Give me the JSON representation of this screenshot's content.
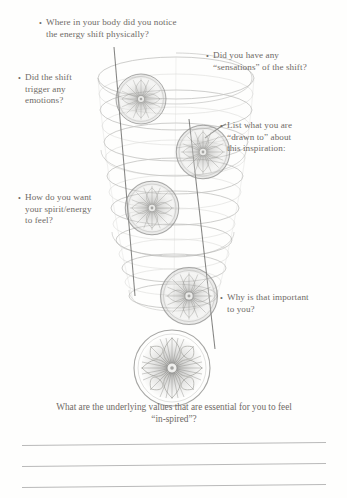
{
  "page": {
    "background_color": "#fefefd",
    "ink_color": "#6e6a66",
    "rule_color": "#b9b9b9",
    "sketch_color": "#9a9a98"
  },
  "questions": [
    {
      "id": "where",
      "bullet": "•",
      "line1": "Where in your body did you notice",
      "line2": "the energy shift physically?",
      "line3": ""
    },
    {
      "id": "sensations",
      "bullet": "•",
      "line1": "Did you have any",
      "line2": "“sensations” of the shift?",
      "line3": ""
    },
    {
      "id": "emotions",
      "bullet": "•",
      "line1": "Did the shift",
      "line2": "trigger any",
      "line3": "emotions?"
    },
    {
      "id": "drawn-to",
      "bullet": "•",
      "line1": "List what you are",
      "line2": "“drawn to” about",
      "line3": "this inspiration:"
    },
    {
      "id": "spirit",
      "bullet": "•",
      "line1": "How do you want",
      "line2": "your spirit/energy",
      "line3": "to feel?"
    },
    {
      "id": "why-important",
      "bullet": "•",
      "line1": "Why is that important",
      "line2": "to you?",
      "line3": ""
    }
  ],
  "caption": {
    "line1": "What are the underlying values that are essential for you to feel",
    "line2": "“in-spired”?"
  },
  "writing_lines": {
    "count": 3,
    "label": "blank ruled answer lines"
  },
  "illustration": {
    "name": "descending-spiral-with-flower-medallions",
    "description": "Pencil sketch of a downward spiral / stacked ellipses with five circular flower medallions descending in size order and two straight guide lines.",
    "medallion_count": 5
  }
}
